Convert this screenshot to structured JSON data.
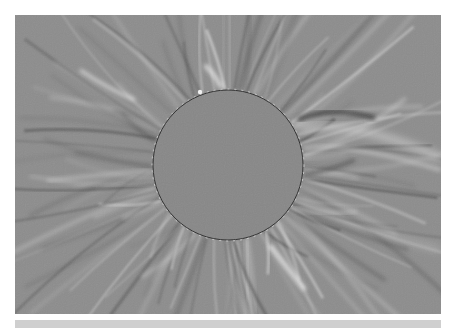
{
  "image": {
    "subject": "processed solar corona during total eclipse",
    "colors": {
      "page_background": "#ffffff",
      "sky_gray": "#8c8c8c",
      "disc_gray": "#878787",
      "bright_streamer": "#d8d8d8",
      "dark_streamer": "#4a4a4a",
      "bottom_strip": "#cfcfcf"
    },
    "frame": {
      "x": 15,
      "y": 15,
      "width": 426,
      "height": 299
    },
    "disc": {
      "cx": 228,
      "cy": 165,
      "r": 75
    }
  }
}
